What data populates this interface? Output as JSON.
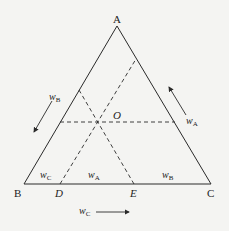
{
  "diagram": {
    "type": "ternary-composition-triangle",
    "vertices": {
      "top": "A",
      "left": "B",
      "right": "C"
    },
    "center_point": "O",
    "base_points": [
      "D",
      "E"
    ],
    "side_labels": {
      "left_side": {
        "var": "w",
        "sub": "B"
      },
      "right_side": {
        "var": "w",
        "sub": "A"
      },
      "bottom": {
        "var": "w",
        "sub": "C"
      }
    },
    "base_segment_labels": [
      {
        "var": "w",
        "sub": "C"
      },
      {
        "var": "w",
        "sub": "A"
      },
      {
        "var": "w",
        "sub": "B"
      }
    ],
    "colors": {
      "line": "#2a2a2a",
      "background": "#f4f4f2"
    }
  }
}
